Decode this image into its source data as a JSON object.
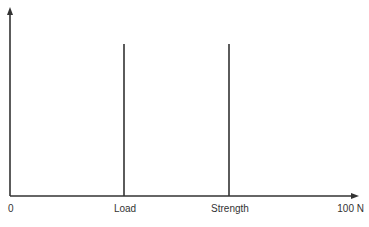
{
  "diagram": {
    "title": "",
    "colors": {
      "axis": "#333333",
      "line": "#333333",
      "text": "#333333",
      "background": "#ffffff"
    },
    "x_axis": {
      "min_label": "0",
      "max_label": "100 N",
      "unit": "N",
      "range": [
        0,
        100
      ]
    },
    "markers": [
      {
        "label": "Load",
        "x_position_fraction": 0.33
      },
      {
        "label": "Strength",
        "x_position_fraction": 0.63
      }
    ]
  }
}
